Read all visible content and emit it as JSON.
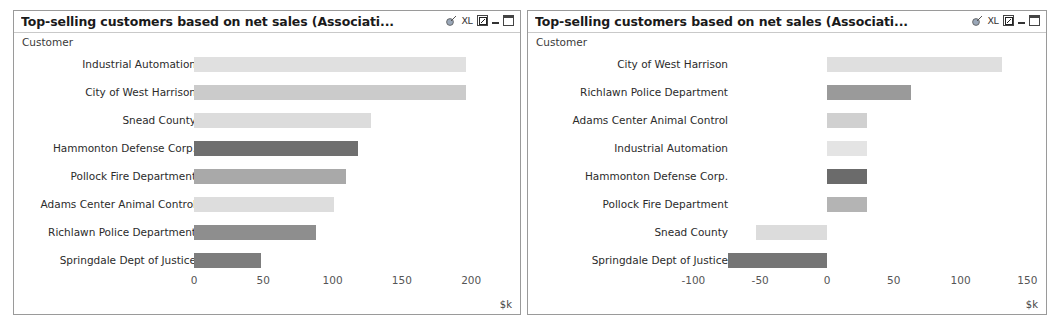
{
  "panels": [
    {
      "id": "left",
      "title": "Top-selling customers based on net sales (Associati...",
      "dimension_label": "Customer",
      "icons": [
        {
          "name": "export-icon",
          "glyph": "◔"
        },
        {
          "name": "excel-export-icon",
          "glyph": "XL"
        },
        {
          "name": "restore-icon",
          "glyph": "▣"
        },
        {
          "name": "minimize-icon",
          "glyph": ""
        },
        {
          "name": "maximize-icon",
          "glyph": ""
        }
      ],
      "unit": "$k",
      "chart_data": {
        "type": "bar",
        "orientation": "horizontal",
        "title": "Top-selling customers based on net sales (Associati...",
        "xlabel": "$k",
        "ylabel": "Customer",
        "xlim": [
          0,
          215
        ],
        "ticks": [
          0,
          50,
          100,
          150,
          200
        ],
        "grid": false,
        "legend": "none",
        "categories": [
          "Industrial Automation",
          "City of West Harrison",
          "Snead County",
          "Hammonton Defense Corp.",
          "Pollock Fire Department",
          "Adams Center Animal Control",
          "Richlawn Police Department",
          "Springdale Dept of Justice"
        ],
        "values": [
          196,
          196,
          128,
          118,
          110,
          101,
          88,
          48
        ],
        "colors": [
          "#e0e0e0",
          "#cbcbcb",
          "#dcdcdc",
          "#6f6f6f",
          "#a9a9a9",
          "#dddddd",
          "#8e8e8e",
          "#7d7d7d"
        ]
      }
    },
    {
      "id": "right",
      "title": "Top-selling customers based on net sales (Associati...",
      "dimension_label": "Customer",
      "icons": [
        {
          "name": "export-icon",
          "glyph": "◔"
        },
        {
          "name": "excel-export-icon",
          "glyph": "XL"
        },
        {
          "name": "restore-icon",
          "glyph": "▣"
        },
        {
          "name": "minimize-icon",
          "glyph": ""
        },
        {
          "name": "maximize-icon",
          "glyph": ""
        }
      ],
      "unit": "$k",
      "chart_data": {
        "type": "bar",
        "orientation": "horizontal",
        "title": "Top-selling customers based on net sales (Associati...",
        "xlabel": "$k",
        "ylabel": "Customer",
        "xlim": [
          -115,
          165
        ],
        "ticks": [
          -100,
          -50,
          0,
          50,
          100,
          150
        ],
        "grid": false,
        "legend": "none",
        "categories": [
          "City of West Harrison",
          "Richlawn Police Department",
          "Adams Center Animal Control",
          "Industrial Automation",
          "Hammonton Defense Corp.",
          "Pollock Fire Department",
          "Snead County",
          "Springdale Dept of Justice"
        ],
        "values": [
          131,
          63,
          30,
          30,
          30,
          30,
          -53,
          -74
        ],
        "colors": [
          "#dfdfdf",
          "#9a9a9a",
          "#d0d0d0",
          "#e4e4e4",
          "#6b6b6b",
          "#b4b4b4",
          "#dcdcdc",
          "#757575"
        ]
      }
    }
  ]
}
